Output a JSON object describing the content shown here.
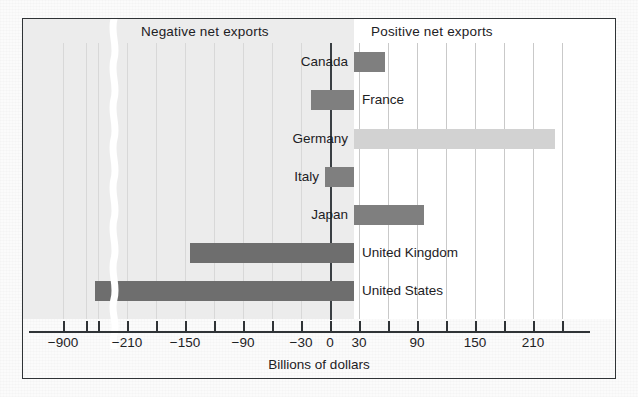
{
  "figure": {
    "axis_title": "Billions of dollars",
    "negative_band_label": "Negative net exports",
    "positive_band_label": "Positive net exports"
  },
  "colors": {
    "frame": "#2f3336",
    "negative_field": "#ececec",
    "positive_field": "#ffffff",
    "bar_dark": "#7f7f7f",
    "bar_darker": "#6e6e6e",
    "bar_light": "#d2d2d2",
    "gridline": "#c9c9c9",
    "text": "#1d2124"
  },
  "chart_data": {
    "type": "bar",
    "orientation": "horizontal",
    "title": "",
    "subtitle": "",
    "xlabel": "Billions of dollars",
    "ylabel": "",
    "categories": [
      "Canada",
      "France",
      "Germany",
      "Italy",
      "Japan",
      "United Kingdom",
      "United States"
    ],
    "values": [
      30,
      -42,
      205,
      -30,
      70,
      -163,
      -900
    ],
    "units": "Billions of dollars",
    "grid": true,
    "legend": null,
    "axis_break": {
      "present": true,
      "between": [
        -240,
        -870
      ],
      "note": "wavy white break in the x-axis between -240 and about -870"
    },
    "xticks": [
      -900,
      -240,
      -210,
      -180,
      -150,
      -120,
      -90,
      -60,
      -30,
      0,
      30,
      60,
      90,
      120,
      150,
      180,
      210,
      240
    ],
    "xtick_labels_shown": [
      "-900",
      "-210",
      "-150",
      "-90",
      "-30",
      "0",
      "30",
      "90",
      "150",
      "210"
    ],
    "xlim": [
      -930,
      250
    ],
    "annotations": [
      "Negative net exports",
      "Positive net exports"
    ],
    "series": [
      {
        "name": "Net exports",
        "points": [
          {
            "category": "Canada",
            "value": 30,
            "shade": "dark"
          },
          {
            "category": "France",
            "value": -42,
            "shade": "dark"
          },
          {
            "category": "Germany",
            "value": 205,
            "shade": "light"
          },
          {
            "category": "Italy",
            "value": -30,
            "shade": "dark"
          },
          {
            "category": "Japan",
            "value": 70,
            "shade": "dark"
          },
          {
            "category": "United Kingdom",
            "value": -163,
            "shade": "darker"
          },
          {
            "category": "United States",
            "value": -900,
            "shade": "darker"
          }
        ]
      }
    ]
  },
  "ticks": [
    {
      "label": "-900",
      "x": 40
    },
    {
      "label": "",
      "x": 63
    },
    {
      "label": "",
      "x": 75
    },
    {
      "label": "-210",
      "x": 104
    },
    {
      "label": "",
      "x": 133
    },
    {
      "label": "-150",
      "x": 162
    },
    {
      "label": "",
      "x": 191
    },
    {
      "label": "-90",
      "x": 220
    },
    {
      "label": "",
      "x": 249
    },
    {
      "label": "-30",
      "x": 278
    },
    {
      "label": "0",
      "x": 307
    },
    {
      "label": "30",
      "x": 336
    },
    {
      "label": "",
      "x": 365
    },
    {
      "label": "90",
      "x": 394
    },
    {
      "label": "",
      "x": 423
    },
    {
      "label": "150",
      "x": 452
    },
    {
      "label": "",
      "x": 481
    },
    {
      "label": "210",
      "x": 510
    },
    {
      "label": "",
      "x": 539
    }
  ],
  "bars": [
    {
      "name": "canada",
      "label": "Canada",
      "label_side": "left",
      "shade": "dark",
      "left": 331,
      "width": 31,
      "top": 33,
      "label_x": 243,
      "label_w": 82
    },
    {
      "name": "france",
      "label": "France",
      "label_side": "right",
      "shade": "dark",
      "left": 288,
      "width": 43,
      "top": 71,
      "label_x": 339,
      "label_w": 90
    },
    {
      "name": "germany",
      "label": "Germany",
      "label_side": "left",
      "shade": "light",
      "left": 331,
      "width": 201,
      "top": 110,
      "label_x": 235,
      "label_w": 90
    },
    {
      "name": "italy",
      "label": "Italy",
      "label_side": "left",
      "shade": "dark",
      "left": 302,
      "width": 29,
      "top": 148,
      "label_x": 232,
      "label_w": 64
    },
    {
      "name": "japan",
      "label": "Japan",
      "label_side": "left",
      "shade": "dark",
      "left": 331,
      "width": 70,
      "top": 186,
      "label_x": 249,
      "label_w": 76
    },
    {
      "name": "united-kingdom",
      "label": "United Kingdom",
      "label_side": "right",
      "shade": "darker",
      "left": 167,
      "width": 164,
      "top": 224,
      "label_x": 339,
      "label_w": 150
    },
    {
      "name": "united-states",
      "label": "United States",
      "label_side": "right",
      "shade": "darker",
      "left": 72,
      "width": 259,
      "top": 262,
      "label_x": 339,
      "label_w": 140
    }
  ]
}
